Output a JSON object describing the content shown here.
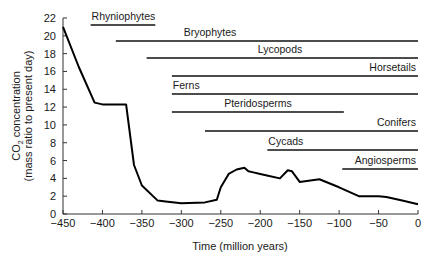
{
  "chart_data": {
    "type": "line",
    "title": "",
    "xlabel": "Time (million years)",
    "ylabel_line1": "CO2 concentration",
    "ylabel_line2": "(mass ratio to present day)",
    "xlim": [
      -450,
      0
    ],
    "ylim": [
      0,
      22
    ],
    "grid": false,
    "x_ticks": [
      -450,
      -400,
      -350,
      -300,
      -250,
      -200,
      -150,
      -100,
      -50,
      0
    ],
    "x_tick_labels": [
      "−450",
      "−400",
      "−350",
      "−300",
      "−250",
      "−200",
      "−150",
      "−100",
      "−50",
      "0"
    ],
    "y_ticks": [
      0,
      2,
      4,
      6,
      8,
      10,
      12,
      14,
      16,
      18,
      20,
      22
    ],
    "y_tick_labels": [
      "0",
      "2",
      "4",
      "6",
      "8",
      "10",
      "12",
      "14",
      "16",
      "18",
      "20",
      "22"
    ],
    "series": [
      {
        "name": "CO2 concentration",
        "x": [
          -450,
          -430,
          -410,
          -400,
          -380,
          -370,
          -360,
          -350,
          -330,
          -320,
          -300,
          -270,
          -255,
          -250,
          -240,
          -230,
          -220,
          -215,
          -210,
          -200,
          -190,
          -175,
          -165,
          -160,
          -150,
          -125,
          -100,
          -75,
          -50,
          -40,
          -20,
          0
        ],
        "y": [
          21,
          16.5,
          12.5,
          12.3,
          12.3,
          12.3,
          5.5,
          3.2,
          1.5,
          1.4,
          1.2,
          1.3,
          1.6,
          3.0,
          4.5,
          5.0,
          5.2,
          4.8,
          4.7,
          4.5,
          4.3,
          4.0,
          4.9,
          4.8,
          3.6,
          3.9,
          3.0,
          2.0,
          2.0,
          1.9,
          1.5,
          1.1
        ]
      }
    ],
    "range_bars": [
      {
        "label": "Rhyniophytes",
        "start": -415,
        "end": -333,
        "label_pos": "left"
      },
      {
        "label": "Bryophytes",
        "start": -383,
        "end": 0,
        "label_pos": "center"
      },
      {
        "label": "Lycopods",
        "start": -344,
        "end": 0,
        "label_pos": "center"
      },
      {
        "label": "Horsetails",
        "start": -312,
        "end": 0,
        "label_pos": "right"
      },
      {
        "label": "Ferns",
        "start": -312,
        "end": 0,
        "label_pos": "left"
      },
      {
        "label": "Pteridosperms",
        "start": -312,
        "end": -94,
        "label_pos": "center"
      },
      {
        "label": "Conifers",
        "start": -270,
        "end": 0,
        "label_pos": "right"
      },
      {
        "label": "Cycads",
        "start": -191,
        "end": 0,
        "label_pos": "left"
      },
      {
        "label": "Angiosperms",
        "start": -96,
        "end": 0,
        "label_pos": "right"
      }
    ]
  }
}
